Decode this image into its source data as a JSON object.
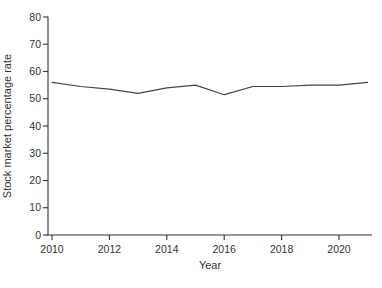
{
  "figure": {
    "background_color": "#ffffff"
  },
  "chart_data": {
    "type": "line",
    "title": "",
    "xlabel": "Year",
    "ylabel": "Stock market percentage rate",
    "x": [
      2010,
      2011,
      2012,
      2013,
      2014,
      2015,
      2016,
      2017,
      2018,
      2019,
      2020,
      2021
    ],
    "series": [
      {
        "name": "Stock market percentage rate",
        "values": [
          56,
          54.5,
          53.5,
          52,
          54,
          55,
          51.5,
          54.5,
          54.5,
          55,
          55,
          56
        ]
      }
    ],
    "xlim": [
      2010,
      2021.5
    ],
    "ylim": [
      0,
      80
    ],
    "x_ticks": [
      2010,
      2012,
      2014,
      2016,
      2018,
      2020
    ],
    "y_ticks": [
      0,
      10,
      20,
      30,
      40,
      50,
      60,
      70,
      80
    ],
    "grid": false,
    "legend": false,
    "line_color": "#454545",
    "axis_color": "#333333",
    "text_color": "#333333"
  }
}
